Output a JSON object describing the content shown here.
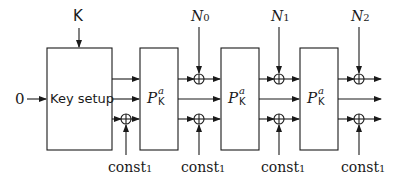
{
  "diagram": {
    "key_input_label": "K",
    "zero_input_label": "0",
    "key_setup_label": "Key setup",
    "permutation": {
      "symbol": "P",
      "superscript": "a",
      "subscript": "K"
    },
    "nonces": [
      {
        "base": "N",
        "index": "0"
      },
      {
        "base": "N",
        "index": "1"
      },
      {
        "base": "N",
        "index": "2"
      }
    ],
    "constants": [
      {
        "base": "const",
        "index": "1"
      },
      {
        "base": "const",
        "index": "1"
      },
      {
        "base": "const",
        "index": "1"
      },
      {
        "base": "const",
        "index": "1"
      }
    ],
    "xor_symbol": "⊕"
  }
}
